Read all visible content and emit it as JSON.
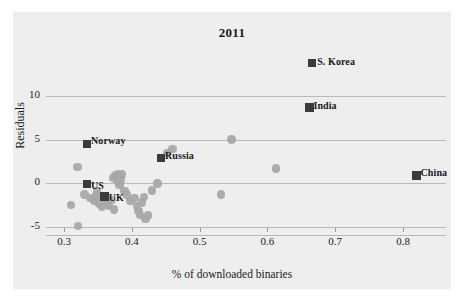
{
  "figure": {
    "background_color": "#ffffff",
    "panel_color": "#eeeeee",
    "point_color": "#a6a6a6",
    "marker_color": "#3b3b3b",
    "grid_color": "#b9b9b9"
  },
  "chart_data": {
    "type": "scatter",
    "title": "2011",
    "xlabel": "% of downloaded binaries",
    "ylabel": "Residuals",
    "xlim": [
      0.285,
      0.84
    ],
    "ylim": [
      -5.6,
      15.2
    ],
    "xticks": [
      0.3,
      0.4,
      0.5,
      0.6,
      0.7,
      0.8
    ],
    "xtick_labels": [
      "0.3",
      "0.4",
      "0.5",
      "0.6",
      "0.7",
      "0.8"
    ],
    "yticks": [
      -5,
      0,
      5,
      10
    ],
    "ytick_labels": [
      "-5",
      "0",
      "5",
      "10"
    ],
    "grid": "horizontal",
    "legend": "none",
    "labeled_points": [
      {
        "label": "S. Korea",
        "x": 0.666,
        "y": 13.8,
        "label_dx": 9,
        "label_dy": -4
      },
      {
        "label": "India",
        "x": 0.662,
        "y": 8.7,
        "label_dx": 8,
        "label_dy": -4
      },
      {
        "label": "China",
        "x": 0.82,
        "y": 0.9,
        "label_dx": 8,
        "label_dy": -5
      },
      {
        "label": "Norway",
        "x": 0.334,
        "y": 4.5,
        "label_dx": 8,
        "label_dy": -6
      },
      {
        "label": "Russia",
        "x": 0.443,
        "y": 2.9,
        "label_dx": 8,
        "label_dy": -5
      },
      {
        "label": "US",
        "x": 0.334,
        "y": -0.1,
        "label_dx": 8,
        "label_dy": -1
      },
      {
        "label": "UK",
        "x": 0.36,
        "y": -1.5,
        "label_dx": 8,
        "label_dy": -1
      }
    ],
    "points": [
      {
        "x": 0.32,
        "y": 1.9
      },
      {
        "x": 0.31,
        "y": -2.5
      },
      {
        "x": 0.321,
        "y": -4.9
      },
      {
        "x": 0.33,
        "y": -1.3
      },
      {
        "x": 0.338,
        "y": -1.7
      },
      {
        "x": 0.344,
        "y": -2.0
      },
      {
        "x": 0.348,
        "y": -1.4
      },
      {
        "x": 0.352,
        "y": -2.3
      },
      {
        "x": 0.356,
        "y": -2.7
      },
      {
        "x": 0.349,
        "y": -0.9
      },
      {
        "x": 0.362,
        "y": -2.1
      },
      {
        "x": 0.366,
        "y": -2.6
      },
      {
        "x": 0.37,
        "y": -1.9
      },
      {
        "x": 0.372,
        "y": 0.6
      },
      {
        "x": 0.376,
        "y": 0.9
      },
      {
        "x": 0.378,
        "y": 0.3
      },
      {
        "x": 0.38,
        "y": 1.1
      },
      {
        "x": 0.382,
        "y": -0.2
      },
      {
        "x": 0.384,
        "y": 0.4
      },
      {
        "x": 0.386,
        "y": 1.0
      },
      {
        "x": 0.374,
        "y": -3.0
      },
      {
        "x": 0.389,
        "y": -0.9
      },
      {
        "x": 0.392,
        "y": -1.3
      },
      {
        "x": 0.398,
        "y": -2.0
      },
      {
        "x": 0.404,
        "y": -1.7
      },
      {
        "x": 0.408,
        "y": -2.6
      },
      {
        "x": 0.41,
        "y": -3.2
      },
      {
        "x": 0.412,
        "y": -3.6
      },
      {
        "x": 0.415,
        "y": -2.2
      },
      {
        "x": 0.418,
        "y": -1.6
      },
      {
        "x": 0.42,
        "y": -4.1
      },
      {
        "x": 0.424,
        "y": -3.7
      },
      {
        "x": 0.43,
        "y": -0.8
      },
      {
        "x": 0.438,
        "y": 0.0
      },
      {
        "x": 0.452,
        "y": 3.5
      },
      {
        "x": 0.46,
        "y": 3.9
      },
      {
        "x": 0.547,
        "y": 5.0
      },
      {
        "x": 0.613,
        "y": 1.7
      },
      {
        "x": 0.532,
        "y": -1.3
      }
    ]
  }
}
